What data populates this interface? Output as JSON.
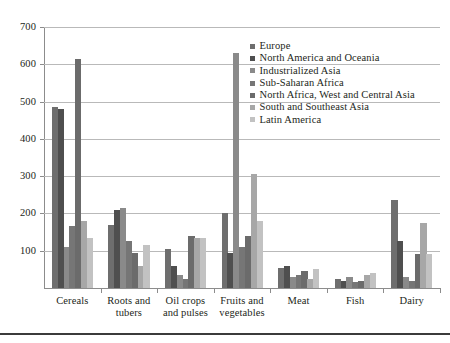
{
  "chart_data": {
    "type": "bar",
    "title": "",
    "xlabel": "",
    "ylabel": "",
    "ylim": [
      0,
      700
    ],
    "yticks": [
      100,
      200,
      300,
      400,
      500,
      600,
      700
    ],
    "grid": true,
    "legend_position": "upper-right-inside",
    "categories": [
      "Cereals",
      "Roots and tubers",
      "Oil crops and pulses",
      "Fruits and vegetables",
      "Meat",
      "Fish",
      "Dairy"
    ],
    "series": [
      {
        "name": "Europe",
        "color": "#6e6e6e",
        "values": [
          485,
          170,
          105,
          200,
          55,
          25,
          235
        ]
      },
      {
        "name": "North America and Oceania",
        "color": "#4f4f4f",
        "values": [
          480,
          210,
          60,
          95,
          60,
          20,
          125
        ]
      },
      {
        "name": "Industrialized Asia",
        "color": "#8a8a8a",
        "values": [
          110,
          215,
          35,
          630,
          30,
          30,
          30
        ]
      },
      {
        "name": "Sub-Saharan Africa",
        "color": "#767676",
        "values": [
          165,
          125,
          25,
          110,
          35,
          15,
          20
        ]
      },
      {
        "name": "North Africa, West and Central Asia",
        "color": "#6b6b6b",
        "values": [
          615,
          95,
          140,
          140,
          45,
          20,
          90
        ]
      },
      {
        "name": "South and Southeast Asia",
        "color": "#a7a7a7",
        "values": [
          180,
          60,
          135,
          305,
          25,
          35,
          175
        ]
      },
      {
        "name": "Latin America",
        "color": "#c2c2c2",
        "values": [
          135,
          115,
          135,
          180,
          50,
          40,
          90
        ]
      }
    ]
  },
  "legend": {
    "items": [
      "Europe",
      "North America and Oceania",
      "Industrialized Asia",
      "Sub-Saharan Africa",
      "North Africa, West and Central Asia",
      "South and Southeast Asia",
      "Latin America"
    ]
  },
  "axis": {
    "y_tick_labels": [
      "700",
      "600",
      "500",
      "400",
      "300",
      "200",
      "100"
    ]
  }
}
